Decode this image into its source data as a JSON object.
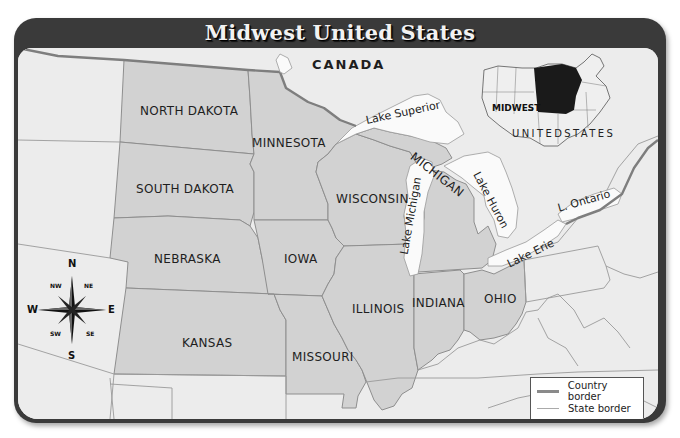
{
  "title": "Midwest United States",
  "colors": {
    "frame": "#3a3a3a",
    "background_land": "#ececec",
    "midwest_fill": "#d2d2d2",
    "water": "#fafafa",
    "country_border": "#8a8a8a",
    "state_border": "#9a9a9a",
    "inset_midwest": "#1a1a1a"
  },
  "labels": {
    "country": "CANADA",
    "states": {
      "north_dakota": "NORTH DAKOTA",
      "south_dakota": "SOUTH DAKOTA",
      "nebraska": "NEBRASKA",
      "kansas": "KANSAS",
      "minnesota": "MINNESOTA",
      "iowa": "IOWA",
      "missouri": "MISSOURI",
      "wisconsin": "WISCONSIN",
      "illinois": "ILLINOIS",
      "michigan": "MICHIGAN",
      "indiana": "INDIANA",
      "ohio": "OHIO"
    },
    "lakes": {
      "superior": "Lake Superior",
      "michigan": "Lake Michigan",
      "huron": "Lake Huron",
      "erie": "Lake Erie",
      "ontario": "L. Ontario"
    }
  },
  "inset": {
    "region_label": "MIDWEST",
    "country_label": "UNITEDSTATES"
  },
  "compass": {
    "n": "N",
    "s": "S",
    "e": "E",
    "w": "W",
    "ne": "NE",
    "nw": "NW",
    "se": "SE",
    "sw": "SW"
  },
  "legend": {
    "items": [
      {
        "label": "Country border",
        "style": "thick"
      },
      {
        "label": "State border",
        "style": "thin"
      }
    ]
  }
}
